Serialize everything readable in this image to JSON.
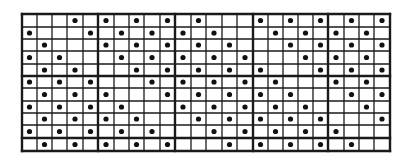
{
  "diagram": {
    "type": "dot-grid",
    "columns": 24,
    "rows": 11,
    "major_column_interval": 5,
    "major_row_interval": 5,
    "colors": {
      "background": "#ffffff",
      "line": "#1a1a1a",
      "dot": "#111111"
    },
    "geometry": {
      "x_lines": [
        22,
        37,
        52,
        67,
        83,
        98,
        114,
        129,
        144,
        160,
        175,
        191,
        206,
        222,
        237,
        253,
        268,
        283,
        298,
        313,
        328,
        344,
        359,
        374,
        390
      ],
      "y_lines": [
        14,
        27,
        39,
        51,
        64,
        76,
        88,
        101,
        113,
        125,
        138,
        151
      ],
      "major_x_lines": [
        22,
        98,
        175,
        253,
        328,
        390
      ],
      "major_y_lines": [
        14,
        76,
        138,
        151
      ]
    },
    "dots_by_row": [
      [
        3,
        5,
        7,
        9,
        11,
        15,
        17,
        19,
        21,
        23
      ],
      [
        0,
        4,
        6,
        8,
        10,
        12,
        16,
        18,
        20,
        22
      ],
      [
        1,
        5,
        7,
        9,
        11,
        13,
        17,
        19,
        21,
        23
      ],
      [
        0,
        2,
        6,
        8,
        10,
        12,
        14,
        18,
        20,
        22
      ],
      [
        1,
        3,
        7,
        9,
        11,
        13,
        15,
        19,
        21,
        23
      ],
      [
        0,
        2,
        4,
        8,
        10,
        12,
        14,
        16,
        20,
        22
      ],
      [
        1,
        3,
        5,
        9,
        11,
        13,
        15,
        17,
        21,
        23
      ],
      [
        0,
        2,
        4,
        6,
        10,
        12,
        14,
        16,
        18,
        22
      ],
      [
        1,
        3,
        5,
        7,
        11,
        13,
        15,
        17,
        19,
        23
      ],
      [
        0,
        2,
        4,
        6,
        8,
        12,
        14,
        16,
        18,
        20
      ],
      [
        1,
        3,
        5,
        7,
        9,
        13,
        15,
        17,
        19,
        21
      ]
    ]
  }
}
